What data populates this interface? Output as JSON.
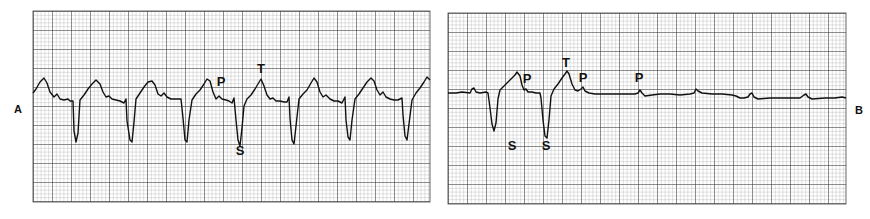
{
  "figure": {
    "panel_labels": [
      "A",
      "B"
    ]
  },
  "chart_data": [
    {
      "type": "line",
      "title": "",
      "panel": "A",
      "description": "ECG rhythm strip with regular wide QRS complexes (deep S waves) and labeled P, T, S waves",
      "xlabel": "",
      "ylabel": "",
      "grid": true,
      "annotations": [
        {
          "text": "P",
          "x": 221,
          "y": 86
        },
        {
          "text": "T",
          "x": 261,
          "y": 73
        },
        {
          "text": "S",
          "x": 240,
          "y": 155
        }
      ],
      "points": [
        [
          33,
          93
        ],
        [
          36,
          89
        ],
        [
          40,
          82
        ],
        [
          44,
          78
        ],
        [
          47,
          83
        ],
        [
          50,
          92
        ],
        [
          54,
          97
        ],
        [
          57,
          94
        ],
        [
          60,
          99
        ],
        [
          64,
          100
        ],
        [
          68,
          99
        ],
        [
          70,
          101
        ],
        [
          73,
          101
        ],
        [
          74,
          131
        ],
        [
          76,
          142
        ],
        [
          78,
          133
        ],
        [
          80,
          100
        ],
        [
          84,
          95
        ],
        [
          88,
          89
        ],
        [
          92,
          84
        ],
        [
          96,
          80
        ],
        [
          100,
          84
        ],
        [
          103,
          92
        ],
        [
          106,
          97
        ],
        [
          109,
          96
        ],
        [
          112,
          99
        ],
        [
          116,
          100
        ],
        [
          120,
          101
        ],
        [
          124,
          103
        ],
        [
          126,
          99
        ],
        [
          127,
          121
        ],
        [
          130,
          140
        ],
        [
          132,
          142
        ],
        [
          134,
          122
        ],
        [
          136,
          99
        ],
        [
          140,
          93
        ],
        [
          144,
          87
        ],
        [
          148,
          82
        ],
        [
          152,
          81
        ],
        [
          155,
          85
        ],
        [
          158,
          94
        ],
        [
          161,
          96
        ],
        [
          164,
          93
        ],
        [
          167,
          97
        ],
        [
          171,
          99
        ],
        [
          175,
          99
        ],
        [
          179,
          99
        ],
        [
          181,
          99
        ],
        [
          183,
          118
        ],
        [
          185,
          140
        ],
        [
          187,
          142
        ],
        [
          189,
          120
        ],
        [
          192,
          100
        ],
        [
          196,
          94
        ],
        [
          200,
          90
        ],
        [
          204,
          84
        ],
        [
          207,
          79
        ],
        [
          210,
          81
        ],
        [
          213,
          92
        ],
        [
          216,
          99
        ],
        [
          219,
          96
        ],
        [
          222,
          99
        ],
        [
          226,
          100
        ],
        [
          229,
          101
        ],
        [
          232,
          103
        ],
        [
          234,
          98
        ],
        [
          236,
          120
        ],
        [
          238,
          140
        ],
        [
          240,
          146
        ],
        [
          242,
          128
        ],
        [
          244,
          106
        ],
        [
          247,
          99
        ],
        [
          251,
          95
        ],
        [
          255,
          89
        ],
        [
          258,
          84
        ],
        [
          261,
          79
        ],
        [
          264,
          86
        ],
        [
          267,
          95
        ],
        [
          270,
          99
        ],
        [
          273,
          98
        ],
        [
          276,
          101
        ],
        [
          280,
          101
        ],
        [
          284,
          102
        ],
        [
          287,
          102
        ],
        [
          289,
          97
        ],
        [
          290,
          118
        ],
        [
          292,
          140
        ],
        [
          294,
          144
        ],
        [
          296,
          126
        ],
        [
          299,
          99
        ],
        [
          303,
          94
        ],
        [
          307,
          90
        ],
        [
          311,
          83
        ],
        [
          314,
          78
        ],
        [
          317,
          82
        ],
        [
          320,
          92
        ],
        [
          323,
          97
        ],
        [
          326,
          95
        ],
        [
          330,
          99
        ],
        [
          334,
          101
        ],
        [
          338,
          101
        ],
        [
          342,
          103
        ],
        [
          345,
          97
        ],
        [
          346,
          120
        ],
        [
          348,
          137
        ],
        [
          350,
          140
        ],
        [
          352,
          120
        ],
        [
          355,
          99
        ],
        [
          359,
          94
        ],
        [
          363,
          88
        ],
        [
          367,
          82
        ],
        [
          371,
          78
        ],
        [
          374,
          81
        ],
        [
          377,
          90
        ],
        [
          380,
          95
        ],
        [
          383,
          92
        ],
        [
          386,
          97
        ],
        [
          390,
          99
        ],
        [
          394,
          100
        ],
        [
          398,
          100
        ],
        [
          402,
          98
        ],
        [
          403,
          115
        ],
        [
          405,
          136
        ],
        [
          407,
          140
        ],
        [
          409,
          124
        ],
        [
          412,
          100
        ],
        [
          416,
          93
        ],
        [
          420,
          88
        ],
        [
          424,
          82
        ],
        [
          427,
          77
        ],
        [
          430,
          80
        ]
      ]
    },
    {
      "type": "line",
      "title": "",
      "panel": "B",
      "description": "ECG rhythm strip showing two wide complexes then continued P waves without QRS (ventricular standstill)",
      "xlabel": "",
      "ylabel": "",
      "grid": true,
      "annotations": [
        {
          "text": "P",
          "x": 527,
          "y": 83
        },
        {
          "text": "T",
          "x": 566,
          "y": 67
        },
        {
          "text": "P",
          "x": 583,
          "y": 82
        },
        {
          "text": "S",
          "x": 512,
          "y": 150
        },
        {
          "text": "S",
          "x": 546,
          "y": 150
        },
        {
          "text": "P",
          "x": 639,
          "y": 82
        }
      ],
      "points": [
        [
          448,
          93
        ],
        [
          456,
          93
        ],
        [
          462,
          92
        ],
        [
          470,
          93
        ],
        [
          472,
          89
        ],
        [
          474,
          88
        ],
        [
          476,
          92
        ],
        [
          480,
          93
        ],
        [
          486,
          92
        ],
        [
          488,
          93
        ],
        [
          490,
          108
        ],
        [
          492,
          124
        ],
        [
          494,
          131
        ],
        [
          496,
          123
        ],
        [
          498,
          99
        ],
        [
          500,
          90
        ],
        [
          503,
          87
        ],
        [
          507,
          83
        ],
        [
          511,
          79
        ],
        [
          515,
          75
        ],
        [
          517,
          72
        ],
        [
          520,
          76
        ],
        [
          522,
          85
        ],
        [
          524,
          90
        ],
        [
          526,
          89
        ],
        [
          528,
          92
        ],
        [
          532,
          92
        ],
        [
          536,
          93
        ],
        [
          540,
          93
        ],
        [
          541,
          98
        ],
        [
          543,
          120
        ],
        [
          545,
          136
        ],
        [
          547,
          138
        ],
        [
          549,
          120
        ],
        [
          551,
          96
        ],
        [
          554,
          89
        ],
        [
          558,
          84
        ],
        [
          562,
          78
        ],
        [
          565,
          74
        ],
        [
          567,
          71
        ],
        [
          569,
          74
        ],
        [
          572,
          84
        ],
        [
          575,
          90
        ],
        [
          578,
          91
        ],
        [
          581,
          89
        ],
        [
          583,
          87
        ],
        [
          585,
          91
        ],
        [
          589,
          93
        ],
        [
          595,
          94
        ],
        [
          605,
          94
        ],
        [
          620,
          94
        ],
        [
          635,
          94
        ],
        [
          638,
          93
        ],
        [
          640,
          90
        ],
        [
          642,
          93
        ],
        [
          645,
          96
        ],
        [
          652,
          95
        ],
        [
          660,
          94
        ],
        [
          670,
          94
        ],
        [
          680,
          95
        ],
        [
          690,
          94
        ],
        [
          694,
          93
        ],
        [
          696,
          89
        ],
        [
          698,
          91
        ],
        [
          702,
          93
        ],
        [
          712,
          94
        ],
        [
          722,
          94
        ],
        [
          732,
          95
        ],
        [
          736,
          96
        ],
        [
          740,
          98
        ],
        [
          744,
          98
        ],
        [
          748,
          97
        ],
        [
          750,
          94
        ],
        [
          752,
          93
        ],
        [
          754,
          97
        ],
        [
          758,
          99
        ],
        [
          770,
          98
        ],
        [
          785,
          98
        ],
        [
          800,
          98
        ],
        [
          804,
          95
        ],
        [
          806,
          94
        ],
        [
          808,
          97
        ],
        [
          812,
          99
        ],
        [
          825,
          98
        ],
        [
          835,
          98
        ],
        [
          842,
          97
        ],
        [
          846,
          98
        ]
      ]
    }
  ]
}
